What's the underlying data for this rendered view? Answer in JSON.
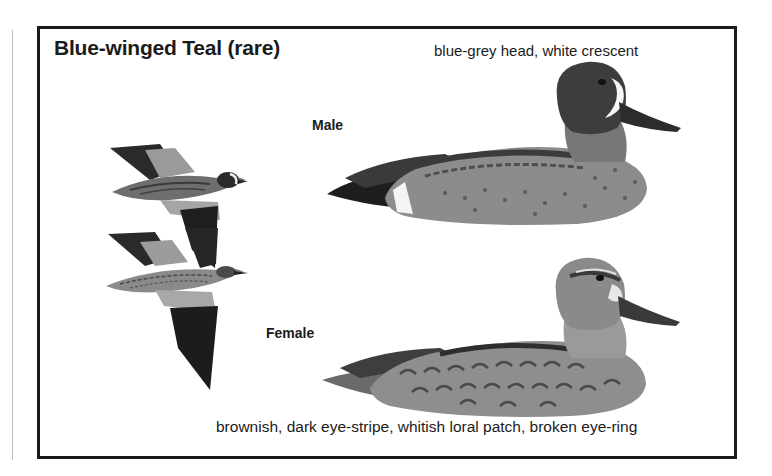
{
  "plate": {
    "title": "Blue-winged Teal (rare)",
    "male": {
      "label": "Male",
      "note": "blue-grey head, white crescent"
    },
    "female": {
      "label": "Female",
      "note": "brownish, dark eye-stripe, whitish loral patch, broken eye-ring"
    },
    "illustrations": [
      "flying-teal-upper",
      "flying-teal-lower",
      "male-teal-swimming",
      "female-teal-swimming"
    ]
  },
  "colors": {
    "frame": "#1a1a1a",
    "background": "#ffffff",
    "text": "#1b1b1b"
  }
}
